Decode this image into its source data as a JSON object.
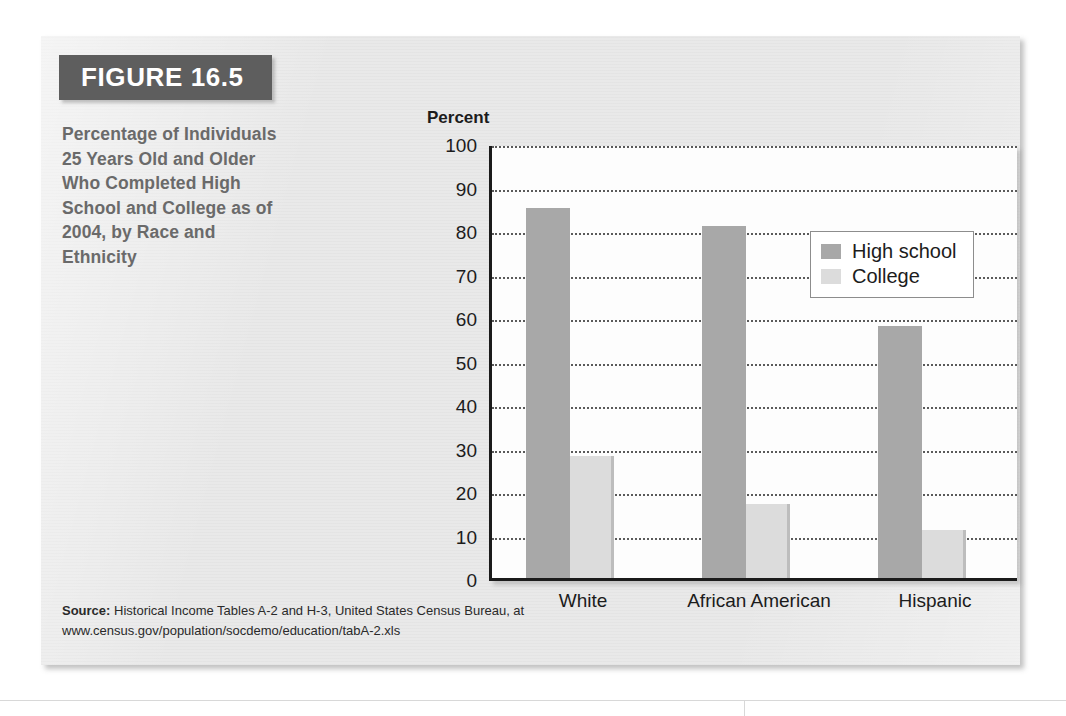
{
  "figure": {
    "badge_label": "FIGURE 16.5",
    "caption": "Percentage of Individuals 25 Years Old and Older Who Completed High School and College as of 2004, by Race and Ethnicity",
    "source_prefix": "Source:",
    "source_text": " Historical Income Tables A-2 and H-3, United States Census Bureau, at",
    "source_url": "www.census.gov/population/socdemo/education/tabA-2.xls"
  },
  "colors": {
    "panel_background": "#e9e9e9",
    "badge_background": "#5e5e5e",
    "caption_text": "#6a6a6a",
    "high_school_bar": "#a8a8a8",
    "college_bar": "#dcdcdc",
    "axis_line": "#1b1b1b",
    "gridline": "#5a5a5a",
    "plot_background": "#fdfdfd"
  },
  "chart_data": {
    "type": "bar",
    "title": "Percentage of Individuals 25 Years Old and Older Who Completed High School and College as of 2004, by Race and Ethnicity",
    "xlabel": "",
    "ylabel": "Percent",
    "ylim": [
      0,
      100
    ],
    "ytick_step": 10,
    "ytick_labels": [
      "100",
      "90",
      "80",
      "70",
      "60",
      "50",
      "40",
      "30",
      "20",
      "10",
      "0"
    ],
    "ytick_values": [
      100,
      90,
      80,
      70,
      60,
      50,
      40,
      30,
      20,
      10,
      0
    ],
    "grid": "horizontal-dotted",
    "legend_position": "top-right-inside",
    "categories": [
      "White",
      "African American",
      "Hispanic"
    ],
    "series": [
      {
        "name": "High school",
        "values": [
          85,
          81,
          58
        ],
        "color": "#a8a8a8"
      },
      {
        "name": "College",
        "values": [
          28,
          17,
          11
        ],
        "color": "#dcdcdc"
      }
    ]
  }
}
